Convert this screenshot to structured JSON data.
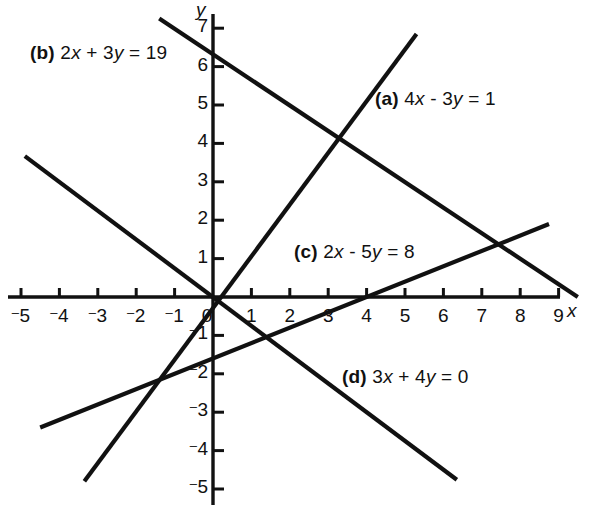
{
  "figure": {
    "background_color": "#ffffff",
    "line_color": "#111111",
    "axis_color": "#111111"
  },
  "axes": {
    "x_axis_name": "x",
    "y_axis_name": "y",
    "x_tick_labels": [
      {
        "value": -5,
        "text": "5",
        "negative": true
      },
      {
        "value": -4,
        "text": "4",
        "negative": true
      },
      {
        "value": -3,
        "text": "3",
        "negative": true
      },
      {
        "value": -2,
        "text": "2",
        "negative": true
      },
      {
        "value": -1,
        "text": "1",
        "negative": true
      },
      {
        "value": 0,
        "text": "0",
        "negative": false
      },
      {
        "value": 1,
        "text": "1",
        "negative": false
      },
      {
        "value": 2,
        "text": "2",
        "negative": false
      },
      {
        "value": 3,
        "text": "3",
        "negative": false
      },
      {
        "value": 4,
        "text": "4",
        "negative": false
      },
      {
        "value": 5,
        "text": "5",
        "negative": false
      },
      {
        "value": 6,
        "text": "6",
        "negative": false
      },
      {
        "value": 7,
        "text": "7",
        "negative": false
      },
      {
        "value": 8,
        "text": "8",
        "negative": false
      },
      {
        "value": 9,
        "text": "9",
        "negative": false
      }
    ],
    "y_tick_labels": [
      {
        "value": 7,
        "text": "7",
        "negative": false
      },
      {
        "value": 6,
        "text": "6",
        "negative": false
      },
      {
        "value": 5,
        "text": "5",
        "negative": false
      },
      {
        "value": 4,
        "text": "4",
        "negative": false
      },
      {
        "value": 3,
        "text": "3",
        "negative": false
      },
      {
        "value": 2,
        "text": "2",
        "negative": false
      },
      {
        "value": 1,
        "text": "1",
        "negative": false
      },
      {
        "value": -1,
        "text": "1",
        "negative": true
      },
      {
        "value": -2,
        "text": "2",
        "negative": true
      },
      {
        "value": -3,
        "text": "3",
        "negative": true
      },
      {
        "value": -4,
        "text": "4",
        "negative": true
      },
      {
        "value": -5,
        "text": "5",
        "negative": true
      }
    ]
  },
  "labels": {
    "a": {
      "tag": "(a)",
      "lhs_1": "4",
      "var_x": "x",
      "op": " - ",
      "lhs_2": "3",
      "var_y": "y",
      "rhs": " = 1"
    },
    "b": {
      "tag": "(b)",
      "lhs_1": "2",
      "var_x": "x",
      "op": " + ",
      "lhs_2": "3",
      "var_y": "y",
      "rhs": " = 19"
    },
    "c": {
      "tag": "(c)",
      "lhs_1": "2",
      "var_x": "x",
      "op": " - ",
      "lhs_2": "5",
      "var_y": "y",
      "rhs": " = 8"
    },
    "d": {
      "tag": "(d)",
      "lhs_1": "3",
      "var_x": "x",
      "op": " + ",
      "lhs_2": "4",
      "var_y": "y",
      "rhs": " = 0"
    }
  },
  "chart_data": {
    "type": "line",
    "title": "",
    "xlabel": "x",
    "ylabel": "y",
    "xlim": [
      -5.4,
      9.8
    ],
    "ylim": [
      -5.4,
      7.4
    ],
    "grid": false,
    "legend": "inline-annotations",
    "axis_ticks": {
      "x": [
        -5,
        -4,
        -3,
        -2,
        -1,
        0,
        1,
        2,
        3,
        4,
        5,
        6,
        7,
        8,
        9
      ],
      "y": [
        -5,
        -4,
        -3,
        -2,
        -1,
        1,
        2,
        3,
        4,
        5,
        6,
        7
      ]
    },
    "series": [
      {
        "name": "(a) 4x - 3y = 1",
        "equation": "4x - 3y = 1",
        "slope": 1.3333,
        "y_intercept": -0.3333,
        "x_intercept": 0.25,
        "endpoints": [
          {
            "x": -3.35,
            "y": -4.8
          },
          {
            "x": 5.3,
            "y": 6.85
          }
        ]
      },
      {
        "name": "(b) 2x + 3y = 19",
        "equation": "2x + 3y = 19",
        "slope": -0.6667,
        "y_intercept": 6.3333,
        "x_intercept": 9.5,
        "endpoints": [
          {
            "x": -1.4,
            "y": 7.25
          },
          {
            "x": 9.5,
            "y": 0
          }
        ]
      },
      {
        "name": "(c) 2x - 5y = 8",
        "equation": "2x - 5y = 8",
        "slope": 0.4,
        "y_intercept": -1.6,
        "x_intercept": 4.0,
        "endpoints": [
          {
            "x": -4.5,
            "y": -3.4
          },
          {
            "x": 8.75,
            "y": 1.9
          }
        ]
      },
      {
        "name": "(d) 3x + 4y = 0",
        "equation": "3x + 4y = 0",
        "slope": -0.75,
        "y_intercept": 0,
        "x_intercept": 0,
        "endpoints": [
          {
            "x": -4.9,
            "y": 3.67
          },
          {
            "x": 6.35,
            "y": -4.76
          }
        ]
      }
    ],
    "intersections": [
      {
        "lines": [
          "a",
          "b"
        ],
        "x": 3.2,
        "y": 4.1
      },
      {
        "lines": [
          "b",
          "c"
        ],
        "x": 7.5,
        "y": 1.4
      },
      {
        "lines": [
          "a",
          "d"
        ],
        "x": 0.0,
        "y": 0.0
      },
      {
        "lines": [
          "c",
          "d"
        ],
        "x": 1.4,
        "y": -1.05
      }
    ]
  }
}
